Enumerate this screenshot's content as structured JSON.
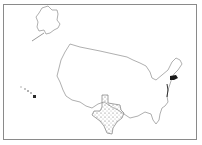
{
  "map": {
    "title": "United States map with Texas highlighted",
    "regions": [
      {
        "name": "Contiguous United States",
        "style": "outline"
      },
      {
        "name": "Alaska",
        "style": "outline"
      },
      {
        "name": "Hawaii",
        "style": "outline-with-dark-island"
      },
      {
        "name": "Texas",
        "style": "stippled"
      },
      {
        "name": "Northeast (Connecticut / Rhode Island area)",
        "style": "filled-dark"
      }
    ],
    "colors": {
      "outline": "#9a9a9a",
      "highlight_fill": "#1a1a1a",
      "stipple": "#6b6b6b",
      "background": "#ffffff",
      "frame": "#8a8a8a"
    }
  }
}
